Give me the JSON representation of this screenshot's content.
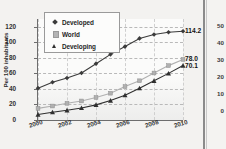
{
  "chart_data": {
    "type": "line",
    "title": "",
    "xlabel": "",
    "ylabel": "Per 100 inhabitants",
    "x": [
      2000,
      2001,
      2002,
      2003,
      2004,
      2005,
      2006,
      2007,
      2008,
      2009,
      2010
    ],
    "tick_labels_x": [
      "2000",
      "2002",
      "2004",
      "2006",
      "2008",
      "2010"
    ],
    "tick_labels_y": [
      "0",
      "20",
      "40",
      "60",
      "80",
      "100",
      "120"
    ],
    "ylim": [
      0,
      130
    ],
    "xlim": [
      2000,
      2010
    ],
    "grid": "horizontal-dashed",
    "legend_position": "top-left",
    "series": [
      {
        "name": "Developed",
        "marker": "diamond",
        "color": "#3b3b3b",
        "values": [
          41.0,
          48.5,
          54.0,
          60.5,
          72.5,
          84.5,
          94.5,
          105.0,
          110.0,
          113.0,
          114.2
        ],
        "end_label": "114.2"
      },
      {
        "name": "World",
        "marker": "square",
        "color": "#b0b0b0",
        "values": [
          15.0,
          18.0,
          21.5,
          24.5,
          29.0,
          34.5,
          43.0,
          50.5,
          60.5,
          70.0,
          78.0
        ],
        "end_label": "78.0"
      },
      {
        "name": "Developing",
        "marker": "triangle",
        "color": "#2f2f2f",
        "values": [
          7.0,
          10.0,
          12.5,
          15.5,
          19.5,
          25.0,
          32.0,
          41.0,
          50.5,
          60.0,
          70.1
        ],
        "end_label": "70.1"
      }
    ]
  },
  "legend": {
    "items": [
      {
        "label": "Developed"
      },
      {
        "label": "World"
      },
      {
        "label": "Developing"
      }
    ]
  },
  "adjacent_chart": {
    "tick_labels_y": [
      "50",
      "40",
      "30",
      "20",
      "10",
      "0"
    ]
  }
}
